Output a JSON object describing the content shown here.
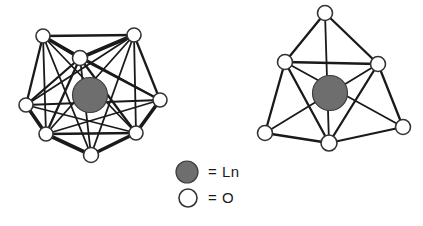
{
  "figure": {
    "background_color": "#ffffff",
    "width": 423,
    "height": 226
  },
  "colors": {
    "ln_fill": "#6e6e6e",
    "ln_stroke": "#3d3d3d",
    "o_fill": "#ffffff",
    "o_stroke": "#333333",
    "bond_stroke": "#1a1a1a",
    "text": "#1a1a1a"
  },
  "legend": {
    "items": [
      {
        "marker": "ln-sphere-marker",
        "marker_type": "filled-circle",
        "marker_fill": "#6e6e6e",
        "marker_cx": 187,
        "marker_cy": 172,
        "marker_r": 11,
        "label": "= Ln",
        "label_x": 208,
        "label_y": 173
      },
      {
        "marker": "o-circle-marker",
        "marker_type": "open-circle",
        "marker_fill": "#ffffff",
        "marker_cx": 188,
        "marker_cy": 198,
        "marker_r": 9,
        "label": "= O",
        "label_x": 208,
        "label_y": 199
      }
    ]
  },
  "structures": [
    {
      "name": "left-polyhedron",
      "description": "Seven-coordinate Ln-O polyhedron",
      "coordination_number": 7,
      "center": {
        "label": "Ln",
        "cx": 90,
        "cy": 95,
        "r": 17.5
      },
      "vertices": [
        {
          "id": "L0",
          "label": "O",
          "cx": 43,
          "cy": 36,
          "r": 7
        },
        {
          "id": "L1",
          "label": "O",
          "cx": 134,
          "cy": 35,
          "r": 7
        },
        {
          "id": "L2",
          "label": "O",
          "cx": 80,
          "cy": 58,
          "r": 7.5
        },
        {
          "id": "L3",
          "label": "O",
          "cx": 26,
          "cy": 105,
          "r": 7
        },
        {
          "id": "L4",
          "label": "O",
          "cx": 160,
          "cy": 100,
          "r": 7
        },
        {
          "id": "L5",
          "label": "O",
          "cx": 46,
          "cy": 134,
          "r": 7
        },
        {
          "id": "L6",
          "label": "O",
          "cx": 136,
          "cy": 133,
          "r": 7
        },
        {
          "id": "L7",
          "label": "O",
          "cx": 91,
          "cy": 155,
          "r": 7.5
        }
      ],
      "edges": [
        [
          "L0",
          "L1"
        ],
        [
          "L0",
          "L2"
        ],
        [
          "L0",
          "L3"
        ],
        [
          "L0",
          "L4"
        ],
        [
          "L0",
          "L5"
        ],
        [
          "L0",
          "L6"
        ],
        [
          "L0",
          "L7"
        ],
        [
          "L1",
          "L2"
        ],
        [
          "L1",
          "L3"
        ],
        [
          "L1",
          "L4"
        ],
        [
          "L1",
          "L5"
        ],
        [
          "L1",
          "L6"
        ],
        [
          "L1",
          "L7"
        ],
        [
          "L2",
          "L3"
        ],
        [
          "L2",
          "L4"
        ],
        [
          "L2",
          "L5"
        ],
        [
          "L2",
          "L6"
        ],
        [
          "L2",
          "L7"
        ],
        [
          "L3",
          "L5"
        ],
        [
          "L3",
          "L6"
        ],
        [
          "L3",
          "L4"
        ],
        [
          "L4",
          "L6"
        ],
        [
          "L4",
          "L5"
        ],
        [
          "L5",
          "L6"
        ],
        [
          "L5",
          "L7"
        ],
        [
          "L6",
          "L7"
        ]
      ]
    },
    {
      "name": "right-polyhedron",
      "description": "Six-coordinate Ln-O polyhedron",
      "coordination_number": 6,
      "center": {
        "label": "Ln",
        "cx": 330,
        "cy": 93,
        "r": 17.5
      },
      "vertices": [
        {
          "id": "R0",
          "label": "O",
          "cx": 325,
          "cy": 13,
          "r": 7.5
        },
        {
          "id": "R1",
          "label": "O",
          "cx": 285,
          "cy": 62,
          "r": 7.5
        },
        {
          "id": "R2",
          "label": "O",
          "cx": 378,
          "cy": 64,
          "r": 7.5
        },
        {
          "id": "R3",
          "label": "O",
          "cx": 265,
          "cy": 133,
          "r": 7.5
        },
        {
          "id": "R4",
          "label": "O",
          "cx": 403,
          "cy": 127,
          "r": 7.5
        },
        {
          "id": "R5",
          "label": "O",
          "cx": 329,
          "cy": 143,
          "r": 8
        }
      ],
      "edges": [
        [
          "R0",
          "R1"
        ],
        [
          "R0",
          "R2"
        ],
        [
          "R0",
          "R5"
        ],
        [
          "R1",
          "R2"
        ],
        [
          "R1",
          "R3"
        ],
        [
          "R1",
          "R4"
        ],
        [
          "R1",
          "R5"
        ],
        [
          "R2",
          "R3"
        ],
        [
          "R2",
          "R4"
        ],
        [
          "R2",
          "R5"
        ],
        [
          "R3",
          "R5"
        ],
        [
          "R4",
          "R5"
        ]
      ]
    }
  ]
}
